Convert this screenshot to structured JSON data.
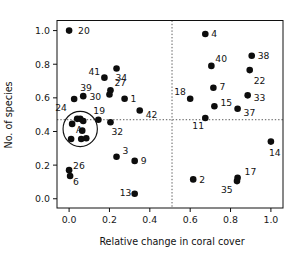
{
  "chart_data": {
    "type": "scatter",
    "title": "",
    "xlabel": "Relative change in coral cover",
    "ylabel": "No. of species",
    "xlim": [
      -0.06,
      1.06
    ],
    "ylim": [
      -0.055,
      1.06
    ],
    "xticks": [
      "0.0",
      "0.2",
      "0.4",
      "0.6",
      "0.8",
      "1.0"
    ],
    "xtick_values": [
      0.0,
      0.2,
      0.4,
      0.6,
      0.8,
      1.0
    ],
    "yticks": [
      "0.0",
      "0.2",
      "0.4",
      "0.6",
      "0.8",
      "1.0"
    ],
    "ytick_values": [
      0.0,
      0.2,
      0.4,
      0.6,
      0.8,
      1.0
    ],
    "grid": false,
    "legend": "none",
    "reference_lines": [
      {
        "name": "vertical-threshold",
        "orientation": "vertical",
        "value": 0.51,
        "style": "dotted"
      },
      {
        "name": "horizontal-threshold",
        "orientation": "horizontal",
        "value": 0.47,
        "style": "dotted"
      }
    ],
    "annotations": [
      {
        "name": "cluster-A",
        "shape": "circle",
        "label": "A",
        "center_x": 0.055,
        "center_y": 0.415,
        "radius_x": 0.085,
        "radius_y": 0.105
      }
    ],
    "points": [
      {
        "label": "20",
        "x": 0.0,
        "y": 1.0,
        "label_dx": 9,
        "label_dy": 3
      },
      {
        "label": "4",
        "x": 0.675,
        "y": 0.98,
        "label_dx": 6,
        "label_dy": 3
      },
      {
        "label": "38",
        "x": 0.905,
        "y": 0.85,
        "label_dx": 6,
        "label_dy": 3
      },
      {
        "label": "40",
        "x": 0.705,
        "y": 0.79,
        "label_dx": 4,
        "label_dy": -4
      },
      {
        "label": "34",
        "x": 0.235,
        "y": 0.775,
        "label_dx": -1,
        "label_dy": 13
      },
      {
        "label": "22",
        "x": 0.895,
        "y": 0.765,
        "label_dx": 4,
        "label_dy": 14
      },
      {
        "label": "41",
        "x": 0.175,
        "y": 0.72,
        "label_dx": -16,
        "label_dy": -3
      },
      {
        "label": "7",
        "x": 0.715,
        "y": 0.66,
        "label_dx": 6,
        "label_dy": 2
      },
      {
        "label": "27",
        "x": 0.205,
        "y": 0.645,
        "label_dx": 4,
        "label_dy": -4
      },
      {
        "label": "30",
        "x": 0.2,
        "y": 0.62,
        "label_dx": -20,
        "label_dy": 6
      },
      {
        "label": "33",
        "x": 0.885,
        "y": 0.615,
        "label_dx": 6,
        "label_dy": 6
      },
      {
        "label": "39",
        "x": 0.07,
        "y": 0.61,
        "label_dx": -3,
        "label_dy": -5
      },
      {
        "label": "1",
        "x": 0.275,
        "y": 0.595,
        "label_dx": 6,
        "label_dy": 3
      },
      {
        "label": "18",
        "x": 0.6,
        "y": 0.595,
        "label_dx": -16,
        "label_dy": -4
      },
      {
        "label": "A1",
        "x": 0.025,
        "y": 0.593,
        "label_dx": 0,
        "label_dy": 0,
        "no_label": true
      },
      {
        "label": "15",
        "x": 0.72,
        "y": 0.55,
        "label_dx": 6,
        "label_dy": 0
      },
      {
        "label": "37",
        "x": 0.835,
        "y": 0.535,
        "label_dx": 6,
        "label_dy": 7
      },
      {
        "label": "42",
        "x": 0.35,
        "y": 0.525,
        "label_dx": 6,
        "label_dy": 8
      },
      {
        "label": "11",
        "x": 0.675,
        "y": 0.48,
        "label_dx": -13,
        "label_dy": 11
      },
      {
        "label": "24",
        "x": 0.04,
        "y": 0.475,
        "label_dx": -22,
        "label_dy": -8
      },
      {
        "label": "19",
        "x": 0.145,
        "y": 0.47,
        "label_dx": -5,
        "label_dy": -6
      },
      {
        "label": "32",
        "x": 0.205,
        "y": 0.455,
        "label_dx": 1,
        "label_dy": 13
      },
      {
        "label": "A2",
        "x": 0.055,
        "y": 0.475,
        "label_dx": 0,
        "label_dy": 0,
        "no_label": true
      },
      {
        "label": "A3",
        "x": 0.07,
        "y": 0.462,
        "label_dx": 0,
        "label_dy": 0,
        "no_label": true
      },
      {
        "label": "A4",
        "x": 0.015,
        "y": 0.445,
        "label_dx": 0,
        "label_dy": 0,
        "no_label": true
      },
      {
        "label": "A5",
        "x": 0.065,
        "y": 0.405,
        "label_dx": 0,
        "label_dy": 0,
        "no_label": true
      },
      {
        "label": "A6",
        "x": 0.01,
        "y": 0.355,
        "label_dx": 0,
        "label_dy": 0,
        "no_label": true
      },
      {
        "label": "A7",
        "x": 0.06,
        "y": 0.355,
        "label_dx": 0,
        "label_dy": 0,
        "no_label": true
      },
      {
        "label": "A8",
        "x": 0.085,
        "y": 0.36,
        "label_dx": 0,
        "label_dy": 0,
        "no_label": true
      },
      {
        "label": "14",
        "x": 1.0,
        "y": 0.34,
        "label_dx": -2,
        "label_dy": 14
      },
      {
        "label": "3",
        "x": 0.235,
        "y": 0.25,
        "label_dx": 6,
        "label_dy": -3
      },
      {
        "label": "9",
        "x": 0.325,
        "y": 0.225,
        "label_dx": 6,
        "label_dy": 3
      },
      {
        "label": "26",
        "x": 0.0,
        "y": 0.17,
        "label_dx": 4,
        "label_dy": -1
      },
      {
        "label": "6",
        "x": 0.005,
        "y": 0.135,
        "label_dx": 3,
        "label_dy": 9
      },
      {
        "label": "17",
        "x": 0.835,
        "y": 0.125,
        "label_dx": 7,
        "label_dy": -3
      },
      {
        "label": "2",
        "x": 0.615,
        "y": 0.115,
        "label_dx": 6,
        "label_dy": 4
      },
      {
        "label": "35",
        "x": 0.832,
        "y": 0.105,
        "label_dx": -16,
        "label_dy": 12
      },
      {
        "label": "13",
        "x": 0.325,
        "y": 0.03,
        "label_dx": -15,
        "label_dy": 2
      }
    ]
  }
}
